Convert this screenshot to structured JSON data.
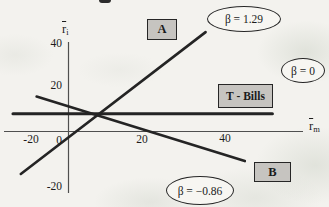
{
  "colors": {
    "paper": "#f3f2ee",
    "box_fill": "#c6c4c0",
    "line": "#242424",
    "axis_line": "#4f4f4f",
    "ellipse_fill": "#f7f6f2"
  },
  "axes": {
    "y_label": {
      "base": "r",
      "sub": "i"
    },
    "x_label": {
      "base": "r",
      "sub": "m"
    },
    "y_ticks": [
      "40",
      "20",
      "-20"
    ],
    "x_ticks": [
      "-20",
      "20",
      "40"
    ],
    "origin": "0"
  },
  "chart_data": {
    "type": "line",
    "title": "",
    "xlabel": "r̄m",
    "ylabel": "r̄i",
    "xlim": [
      -16,
      60
    ],
    "ylim": [
      -29,
      41
    ],
    "x_tick_values": [
      -20,
      0,
      20,
      40
    ],
    "y_tick_values": [
      -20,
      20,
      40
    ],
    "grid": false,
    "legend_position": "annotations-on-plot",
    "series": [
      {
        "name": "Stock A",
        "label": "A",
        "beta": 1.29,
        "beta_label": "β = 1.29",
        "points": [
          [
            -12,
            -20
          ],
          [
            35,
            46
          ]
        ]
      },
      {
        "name": "T-Bills",
        "label": "T - Bills",
        "beta": 0,
        "beta_label": "β = 0",
        "points": [
          [
            -14,
            8
          ],
          [
            52,
            8
          ]
        ]
      },
      {
        "name": "Stock B",
        "label": "B",
        "beta": -0.86,
        "beta_label": "β = −0.86",
        "points": [
          [
            -8,
            16
          ],
          [
            45,
            -14
          ]
        ]
      }
    ]
  },
  "chart_layout": {
    "origin_px": [
      68,
      131
    ],
    "px_per_unit": [
      3.93,
      2.15
    ],
    "stroke": "#242424",
    "series_widths": [
      2.6,
      3.1,
      2.6
    ]
  }
}
